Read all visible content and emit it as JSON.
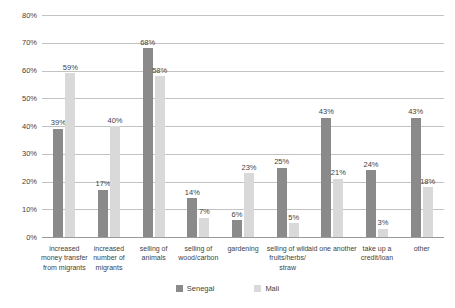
{
  "chart_data": {
    "type": "bar",
    "title": "",
    "categories": [
      "increased money transfer from migrants",
      "increased number of migrants",
      "selling of animals",
      "selling of wood/carbon",
      "gardening",
      "selling of wild fruits/herbs/ straw",
      "aid one another",
      "take up a credit/loan",
      "other"
    ],
    "series": [
      {
        "name": "Senegal",
        "color": "#8a8a8a",
        "values": [
          39,
          17,
          68,
          14,
          6,
          25,
          43,
          24,
          43
        ]
      },
      {
        "name": "Mali",
        "color": "#d9d9d9",
        "values": [
          59,
          40,
          58,
          7,
          23,
          5,
          21,
          3,
          18
        ]
      }
    ],
    "data_label_suffix": "%",
    "ylim": [
      0,
      80
    ],
    "yticks": [
      "0%",
      "10%",
      "20%",
      "30%",
      "40%",
      "50%",
      "60%",
      "70%",
      "80%"
    ],
    "grid": true,
    "legend_position": "bottom",
    "colors": {
      "gridline": "#c3c3c3",
      "axis": "#9a9a9a",
      "text": "#3f3f3f",
      "background": "#ffffff"
    }
  }
}
